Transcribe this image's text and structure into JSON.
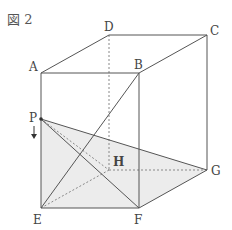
{
  "title": "図 2",
  "labels": {
    "A": "A",
    "B": "B",
    "C": "C",
    "D": "D",
    "E": "E",
    "F": "F",
    "G": "G",
    "H": "H",
    "P": "P"
  },
  "colors": {
    "line": "#555555",
    "dashed": "#888888",
    "shade": "#ececec"
  }
}
